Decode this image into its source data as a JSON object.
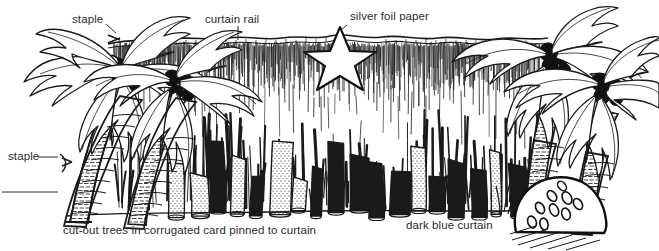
{
  "figure": {
    "type": "line-illustration",
    "background_color": "#ffffff",
    "ink_color": "#1a1a1a",
    "text_color": "#2b2b2b",
    "width": 659,
    "height": 251
  },
  "labels": {
    "staple_top": "staple",
    "curtain_rail": "curtain rail",
    "silver_foil_paper": "silver foil paper",
    "staple_left": "staple",
    "cut_out_trees": "cut-out trees in corrugated card pinned to curtain",
    "dark_blue_curtain": "dark blue curtain"
  },
  "elements": {
    "star": {
      "name": "silver foil paper star",
      "points": 5,
      "fill": "#ffffff",
      "stroke": "#111111"
    },
    "palm_trees_left": 2,
    "palm_trees_right": 2,
    "coconut_clusters": 4,
    "rock": {
      "name": "rock with pebbles",
      "position": "bottom-right"
    },
    "curtain": {
      "name": "dark blue curtain",
      "rendering": "vertical pen hatching",
      "rail": "wavy horizontal band across top"
    },
    "cut_out_tree_row": {
      "name": "row of corrugated card tree trunks",
      "count": 18
    }
  },
  "ghost_text_top": "·  ·   ·    ·"
}
